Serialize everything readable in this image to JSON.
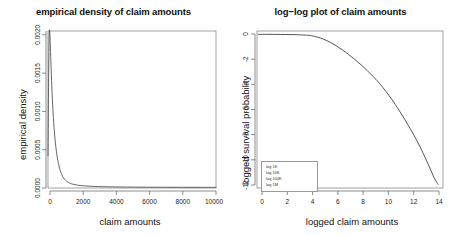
{
  "figure": {
    "background": "#ffffff",
    "line_color": "#555555",
    "axis_color": "#888888"
  },
  "chart_data": [
    {
      "type": "line",
      "panel": "left",
      "title": "empirical density of claim amounts",
      "xlabel": "claim amounts",
      "ylabel": "empirical density",
      "xlim": [
        0,
        10000
      ],
      "ylim": [
        0,
        0.00205
      ],
      "grid": false,
      "legend": null,
      "xticks": [
        0,
        2000,
        4000,
        6000,
        8000,
        10000
      ],
      "xticklabels": [
        "0",
        "2000",
        "4000",
        "6000",
        "8000",
        "10000"
      ],
      "yticks": [
        0.0,
        0.0005,
        0.001,
        0.0015,
        0.002
      ],
      "yticklabels": [
        "0.0000",
        "0.0005",
        "0.0010",
        "0.0015",
        "0.0020"
      ],
      "series": [
        {
          "name": "empirical density",
          "x": [
            0,
            40,
            80,
            120,
            160,
            200,
            260,
            320,
            400,
            500,
            620,
            760,
            900,
            1050,
            1200,
            1400,
            1600,
            1900,
            2200,
            2600,
            3000,
            3500,
            4000,
            4600,
            5200,
            6000,
            7000,
            8000,
            9000,
            10000
          ],
          "y": [
            0.00042,
            0.0015,
            0.00204,
            0.00196,
            0.00172,
            0.00148,
            0.00116,
            0.00092,
            0.00068,
            0.00048,
            0.00032,
            0.00021,
            0.00014,
            0.0001,
            7.5e-05,
            5.5e-05,
            4.4e-05,
            3.3e-05,
            2.7e-05,
            2.2e-05,
            1.9e-05,
            1.6e-05,
            1.4e-05,
            1.25e-05,
            1.15e-05,
            1.05e-05,
            9.8e-06,
            9.2e-06,
            8.9e-06,
            8.6e-06
          ]
        }
      ]
    },
    {
      "type": "line",
      "panel": "right",
      "title": "log−log plot of claim amounts",
      "xlabel": "logged claim amounts",
      "ylabel": "logged survival probability",
      "xlim": [
        -0.4,
        14.6
      ],
      "ylim": [
        -12.4,
        0.25
      ],
      "grid": false,
      "xticks": [
        0,
        2,
        4,
        6,
        8,
        10,
        12,
        14
      ],
      "xticklabels": [
        "0",
        "2",
        "4",
        "6",
        "8",
        "10",
        "12",
        "14"
      ],
      "yticks": [
        0,
        -2,
        -4,
        -6,
        -8,
        -10,
        -12
      ],
      "yticklabels": [
        "0",
        "-2",
        "-4",
        "-6",
        "-8",
        "-10",
        "-12"
      ],
      "legend": {
        "position": "bottom-left",
        "items": [
          "log 1K",
          "log 10K",
          "log 100K",
          "log 1M"
        ]
      },
      "series": [
        {
          "name": "logged survival probability",
          "x": [
            -0.3,
            0.5,
            1.5,
            2.5,
            3.5,
            4.0,
            4.5,
            5.0,
            5.5,
            6.0,
            6.5,
            7.0,
            7.5,
            8.0,
            8.5,
            9.0,
            9.5,
            10.0,
            10.5,
            11.0,
            11.5,
            12.0,
            12.5,
            13.0,
            13.5,
            13.9,
            14.2
          ],
          "y": [
            -0.02,
            -0.02,
            -0.03,
            -0.04,
            -0.08,
            -0.13,
            -0.25,
            -0.42,
            -0.66,
            -0.95,
            -1.28,
            -1.65,
            -2.05,
            -2.48,
            -2.95,
            -3.45,
            -4.0,
            -4.62,
            -5.3,
            -6.05,
            -6.85,
            -7.7,
            -8.6,
            -9.6,
            -10.7,
            -11.6,
            -12.1
          ]
        }
      ]
    }
  ]
}
